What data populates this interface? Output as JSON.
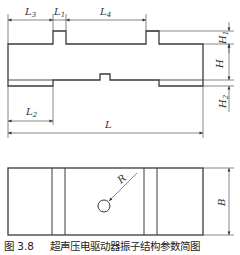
{
  "figure": {
    "number": "图 3.8",
    "title": "超声压电驱动器振子结构参数简图"
  },
  "side_view": {
    "dimensions": {
      "L3": {
        "base": "L",
        "sub": "3"
      },
      "L1": {
        "base": "L",
        "sub": "1"
      },
      "L4": {
        "base": "L",
        "sub": "4"
      },
      "L2": {
        "base": "L",
        "sub": "2"
      },
      "L": {
        "base": "L",
        "sub": ""
      },
      "H1": {
        "base": "H",
        "sub": "1"
      },
      "H": {
        "base": "H",
        "sub": ""
      },
      "H2": {
        "base": "H",
        "sub": "2"
      }
    }
  },
  "top_view": {
    "dimensions": {
      "R": {
        "base": "R",
        "sub": ""
      },
      "B": {
        "base": "B",
        "sub": ""
      }
    }
  },
  "colors": {
    "line": "#3a3a3a",
    "background": "#ffffff"
  }
}
